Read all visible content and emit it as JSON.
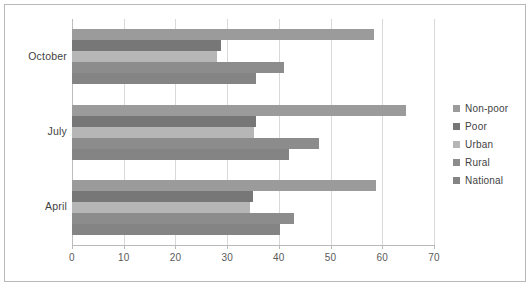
{
  "chart_data": {
    "type": "bar",
    "orientation": "horizontal",
    "title": "",
    "xlabel": "",
    "ylabel": "",
    "categories": [
      "April",
      "July",
      "October"
    ],
    "display_order_top_to_bottom": [
      "October",
      "July",
      "April"
    ],
    "series": [
      {
        "name": "Non-poor",
        "color": "#9b9b9b",
        "values": [
          58.8,
          64.5,
          58.4
        ]
      },
      {
        "name": "Poor",
        "color": "#777777",
        "values": [
          35.0,
          35.5,
          28.8
        ]
      },
      {
        "name": "Urban",
        "color": "#b6b6b6",
        "values": [
          34.5,
          35.2,
          28.0
        ]
      },
      {
        "name": "Rural",
        "color": "#8c8c8c",
        "values": [
          43.0,
          47.8,
          41.0
        ]
      },
      {
        "name": "National",
        "color": "#848484",
        "values": [
          40.2,
          42.0,
          35.5
        ]
      }
    ],
    "xlim": [
      0,
      70
    ],
    "xticks": [
      0,
      10,
      20,
      30,
      40,
      50,
      60,
      70
    ],
    "xtick_labels": [
      "0",
      "10",
      "20",
      "30",
      "40",
      "50",
      "60",
      "70"
    ],
    "grid": "vertical",
    "legend_position": "right",
    "legend_entries": [
      "Non-poor",
      "Poor",
      "Urban",
      "Rural",
      "National"
    ],
    "plot_background": "#ffffff",
    "border_color": "#b8b8b8",
    "gridline_color": "#d9d9d9"
  }
}
